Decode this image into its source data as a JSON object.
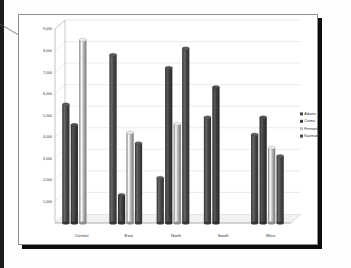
{
  "panel": {
    "background": "#ffffff",
    "border_color": "#8e8e8e",
    "shadow_color": "#0d0d0d"
  },
  "callout": {
    "name": "callout-leader-line",
    "color": "#555555"
  },
  "chart_data": {
    "type": "bar",
    "subtype": "3d-clustered-cylinder",
    "title": "",
    "xlabel": "",
    "ylabel": "",
    "ylim": [
      0,
      9000
    ],
    "ytick_step": 1000,
    "grid": true,
    "legend_position": "right",
    "categories": [
      "Central",
      "East",
      "North",
      "South",
      "West"
    ],
    "ytick_labels": [
      "1,000",
      "2,000",
      "3,000",
      "4,000",
      "5,000",
      "6,000",
      "7,000",
      "8,000",
      "9,000"
    ],
    "ytick_values": [
      1000,
      2000,
      3000,
      4000,
      5000,
      6000,
      7000,
      8000,
      9000
    ],
    "series": [
      {
        "name": "Adams",
        "color": "#4a4a4a",
        "values": [
          5500,
          7800,
          2100,
          4900,
          4100
        ]
      },
      {
        "name": "Cisma",
        "color": "#3f3f3f",
        "values": [
          4550,
          1300,
          7200,
          6300,
          4900
        ]
      },
      {
        "name": "Fernandez",
        "color": "#bdbdbd",
        "values": [
          8500,
          4200,
          4600,
          null,
          3500
        ]
      },
      {
        "name": "Kazmarek",
        "color": "#4a4a4a",
        "values": [
          null,
          3700,
          8100,
          null,
          3100
        ]
      }
    ]
  },
  "legend": {
    "items": [
      {
        "label": "Adams",
        "swatch": "#4a4a4a"
      },
      {
        "label": "Cisma",
        "swatch": "#3f3f3f"
      },
      {
        "label": "Fernandez",
        "swatch": "#bdbdbd"
      },
      {
        "label": "Kazmarek",
        "swatch": "#4a4a4a"
      }
    ]
  },
  "axis": {
    "line_color": "#9a9a9a",
    "grid_color": "#d4d4d4",
    "floor_color": "#f2f2f2"
  }
}
